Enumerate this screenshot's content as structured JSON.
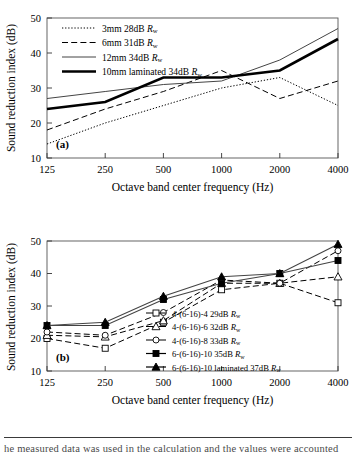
{
  "figure": {
    "caption_fragment": "he measured data was used in the calculation and the values were accounted",
    "panel_a_letter": "(a)",
    "panel_b_letter": "(b)"
  },
  "axes": {
    "y_label": "Sound reduction index (dB)",
    "x_label": "Octave band center frequency (Hz)",
    "y_ticks": [
      "10",
      "20",
      "30",
      "40",
      "50"
    ],
    "x_ticks": [
      "125",
      "250",
      "500",
      "1000",
      "2000",
      "4000"
    ],
    "y_min": 10,
    "y_max": 50,
    "rw_symbol": "R",
    "rw_subscript": "w"
  },
  "chart_data": [
    {
      "type": "line",
      "panel": "(a)",
      "title": "",
      "xlabel": "Octave band center frequency (Hz)",
      "ylabel": "Sound reduction index (dB)",
      "x": [
        125,
        250,
        500,
        1000,
        2000,
        4000
      ],
      "categories": [
        "125",
        "250",
        "500",
        "1000",
        "2000",
        "4000"
      ],
      "ylim": [
        10,
        50
      ],
      "grid": false,
      "legend_position": "top-left",
      "series": [
        {
          "name": "3mm 28dB Rw",
          "label_main": "3mm 28dB ",
          "style": "dotted",
          "width": 1,
          "marker": "none",
          "values": [
            14,
            20,
            25,
            30,
            33,
            25
          ]
        },
        {
          "name": "6mm 31dB Rw",
          "label_main": "6mm 31dB ",
          "style": "dashed",
          "width": 1,
          "marker": "none",
          "values": [
            18,
            24,
            29,
            35,
            27,
            32
          ]
        },
        {
          "name": "12mm 34dB Rw",
          "label_main": "12mm 34dB ",
          "style": "solid",
          "width": 1,
          "marker": "none",
          "values": [
            27,
            29,
            31,
            32,
            38,
            47
          ]
        },
        {
          "name": "10mm laminated 34dB Rw",
          "label_main": "10mm laminated  34dB ",
          "style": "solid",
          "width": 2.6,
          "marker": "none",
          "values": [
            24,
            26,
            33,
            33,
            35,
            44
          ]
        }
      ]
    },
    {
      "type": "line",
      "panel": "(b)",
      "title": "",
      "xlabel": "Octave band center frequency (Hz)",
      "ylabel": "Sound reduction index (dB)",
      "x": [
        125,
        250,
        500,
        1000,
        2000,
        4000
      ],
      "categories": [
        "125",
        "250",
        "500",
        "1000",
        "2000",
        "4000"
      ],
      "ylim": [
        10,
        50
      ],
      "grid": false,
      "legend_position": "bottom-right",
      "series": [
        {
          "name": "4-(6-16)-4 29dB Rw",
          "label_main": "4-(6-16)-4 29dB",
          "style": "dashed",
          "width": 1,
          "marker": "open-square",
          "values": [
            20,
            17,
            25,
            35,
            37,
            31
          ]
        },
        {
          "name": "4-(6-16)-6 32dB Rw",
          "label_main": "4-(6-16)-6 32dB",
          "style": "dashed",
          "width": 1,
          "marker": "open-triangle",
          "values": [
            21,
            20.5,
            25.5,
            37,
            37,
            39
          ]
        },
        {
          "name": "4-(6-16)-8 33dB Rw",
          "label_main": "4-(6-16)-8 33dB",
          "style": "dashed",
          "width": 1,
          "marker": "open-circle",
          "values": [
            22,
            21,
            28,
            38,
            37,
            47
          ]
        },
        {
          "name": "6-(6-16)-10 35dB Rw",
          "label_main": "6-(6-16)-10 35dB",
          "style": "solid",
          "width": 1.2,
          "marker": "filled-square",
          "values": [
            24,
            24,
            32,
            37,
            40,
            44
          ]
        },
        {
          "name": "6-(6-16)-10 laminated 37dB Rw",
          "label_main": "6-(6-16)-10 laminated  37dB",
          "style": "solid",
          "width": 1.2,
          "marker": "filled-triangle",
          "values": [
            24,
            25,
            33,
            39,
            40,
            49
          ]
        }
      ]
    }
  ]
}
